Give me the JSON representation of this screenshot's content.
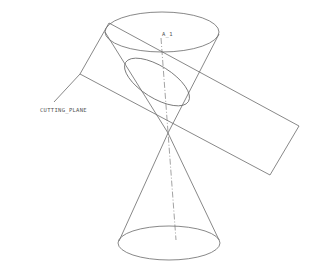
{
  "diagram": {
    "type": "cad-wireframe",
    "labels": {
      "cutting_plane": "CUTTING_PLANE",
      "axis": "A_1"
    },
    "colors": {
      "line": "#6a6a6a",
      "background": "#ffffff"
    }
  }
}
